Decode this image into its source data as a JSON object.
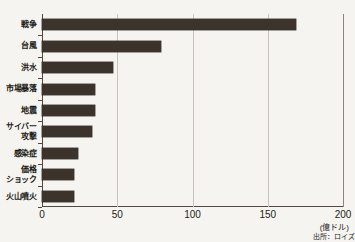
{
  "chart_data": {
    "type": "bar",
    "orientation": "horizontal",
    "title": "",
    "xlabel": "(億ドル)",
    "ylabel": "",
    "xlim": [
      0,
      200
    ],
    "xticks": [
      "0",
      "50",
      "100",
      "150",
      "200"
    ],
    "xtick_values": [
      0,
      50,
      100,
      150,
      200
    ],
    "grid": true,
    "grid_axis": "x",
    "legend": false,
    "categories": [
      "戦争",
      "台風",
      "洪水",
      "市場暴落",
      "地震",
      "サイバー\n攻撃",
      "感染症",
      "価格\nショック",
      "火山噴火"
    ],
    "values": [
      169,
      79,
      47,
      35,
      35,
      33,
      24,
      21,
      21
    ],
    "bar_color": "#3b332c",
    "background_color": "#f6f4f0",
    "grid_color": "#c9c4bc",
    "axis_color": "#52483f"
  },
  "annotations": {
    "unit": "(億ドル)",
    "source": "出所：ロイズ"
  }
}
